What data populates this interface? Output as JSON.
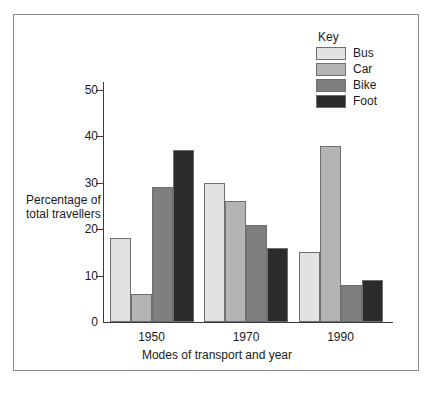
{
  "chart_data": {
    "type": "bar",
    "title": "",
    "xlabel": "Modes of transport and year",
    "ylabel": "Percentage of total travellers",
    "ylabel_lines": [
      "Percentage of",
      "total travellers"
    ],
    "categories": [
      "1950",
      "1970",
      "1990"
    ],
    "series": [
      {
        "name": "Bus",
        "color": "#e2e2e2",
        "values": [
          18,
          30,
          15
        ]
      },
      {
        "name": "Car",
        "color": "#b4b4b4",
        "values": [
          6,
          26,
          38
        ]
      },
      {
        "name": "Bike",
        "color": "#7e7e7e",
        "values": [
          29,
          21,
          8
        ]
      },
      {
        "name": "Foot",
        "color": "#2b2b2b",
        "values": [
          37,
          16,
          9
        ]
      }
    ],
    "ylim": [
      0,
      50
    ],
    "yticks": [
      0,
      10,
      20,
      30,
      40,
      50
    ],
    "ytick_labels": [
      "0",
      "10",
      "20",
      "30",
      "40",
      "50"
    ],
    "grid": false,
    "legend_position": "top-right",
    "legend_title": "Key"
  }
}
